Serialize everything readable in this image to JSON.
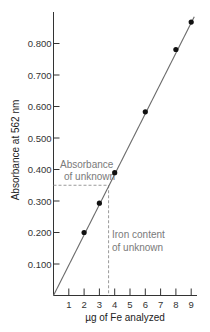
{
  "chart_data": {
    "type": "scatter",
    "title": "",
    "xlabel": "µg of Fe analyzed",
    "ylabel": "Absorbance at 562 nm",
    "xlim": [
      0,
      9.4
    ],
    "ylim": [
      0,
      0.9
    ],
    "x_ticks": [
      1,
      2,
      3,
      4,
      5,
      6,
      7,
      8,
      9
    ],
    "x_tick_labels": [
      "1",
      "2",
      "3",
      "4",
      "5",
      "6",
      "7",
      "8",
      "9"
    ],
    "y_ticks": [
      0.1,
      0.2,
      0.3,
      0.4,
      0.5,
      0.6,
      0.7,
      0.8
    ],
    "y_tick_labels": [
      "0.100",
      "0.200",
      "0.300",
      "0.400",
      "0.500",
      "0.600",
      "0.700",
      "0.800"
    ],
    "grid": false,
    "legend": null,
    "series": [
      {
        "name": "Standards",
        "type": "scatter",
        "x": [
          2,
          3,
          4,
          6,
          8,
          9
        ],
        "y": [
          0.2,
          0.293,
          0.39,
          0.583,
          0.781,
          0.868
        ]
      },
      {
        "name": "Calibration line",
        "type": "line",
        "x": [
          0,
          9.2
        ],
        "y": [
          0,
          0.885
        ]
      }
    ],
    "annotations": [
      {
        "text_lines": [
          "Absorbance",
          "of unknown"
        ],
        "value_y": 0.35,
        "style": "dashed-horizontal"
      },
      {
        "text_lines": [
          "Iron content",
          "of unknown"
        ],
        "value_x": 3.6,
        "style": "dashed-vertical"
      }
    ]
  },
  "labels": {
    "xlabel": "µg of Fe analyzed",
    "ylabel": "Absorbance at 562 nm",
    "annot_abs_1": "Absorbance",
    "annot_abs_2": "of unknown",
    "annot_iron_1": "Iron content",
    "annot_iron_2": "of unknown"
  },
  "colors": {
    "axis": "#333333",
    "line": "#6b6b6b",
    "points": "#111111",
    "dashed": "#9a9a9a",
    "annotation_text": "#7a7a7a"
  }
}
